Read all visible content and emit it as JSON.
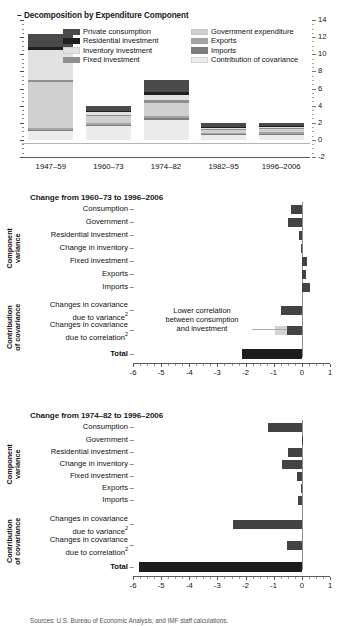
{
  "chart_data": [
    {
      "type": "bar",
      "title": "Decomposition by Expenditure Component",
      "stacked": true,
      "orientation": "vertical",
      "categories": [
        "1947–59",
        "1960–73",
        "1974–82",
        "1982–95",
        "1996–2006"
      ],
      "ylim": [
        -2,
        14
      ],
      "yticks": [
        -2,
        0,
        2,
        4,
        6,
        8,
        10,
        12,
        14
      ],
      "ytick_labels": [
        "-2",
        "0",
        "2",
        "4",
        "6",
        "8",
        "10",
        "12",
        "14"
      ],
      "xlabel": "",
      "ylabel": "",
      "grid": false,
      "legend_position": "top-inside",
      "series": [
        {
          "name": "Private consumption",
          "color": "#4a4a4a",
          "values": [
            1.5,
            0.62,
            1.45,
            0.55,
            0.4
          ]
        },
        {
          "name": "Residential investment",
          "color": "#1f1f1f",
          "values": [
            0.35,
            0.12,
            0.35,
            0.1,
            0.12
          ]
        },
        {
          "name": "Inventory investment",
          "color": "#e2e2e2",
          "values": [
            3.55,
            0.3,
            0.55,
            0.1,
            0.08
          ]
        },
        {
          "name": "Fixed investment",
          "color": "#8f8f8f",
          "values": [
            0.22,
            0.18,
            0.3,
            0.12,
            0.15
          ]
        },
        {
          "name": "Government expenditure",
          "color": "#d0d0d0",
          "values": [
            5.4,
            0.85,
            1.6,
            0.35,
            0.3
          ]
        },
        {
          "name": "Exports",
          "color": "#a3a3a3",
          "values": [
            0.22,
            0.18,
            0.22,
            0.1,
            0.22
          ]
        },
        {
          "name": "Imports",
          "color": "#7d7d7d",
          "values": [
            0.18,
            0.15,
            0.2,
            0.1,
            0.18
          ]
        },
        {
          "name": "Contribution of covariance",
          "color": "#ececec",
          "values": [
            0.98,
            1.6,
            2.33,
            0.58,
            0.55
          ]
        }
      ]
    },
    {
      "type": "bar",
      "orientation": "horizontal",
      "title": "Change from 1960–73 to 1996–2006",
      "xlim": [
        -6,
        1
      ],
      "xticks": [
        -6,
        -5,
        -4,
        -3,
        -2,
        -1,
        0,
        1
      ],
      "xtick_labels": [
        "-6",
        "-5",
        "-4",
        "-3",
        "-2",
        "-1",
        "0",
        "1"
      ],
      "group_captions": [
        "Component\nvariance",
        "Contribution\nof covariance"
      ],
      "categories": [
        "Consumption",
        "Government",
        "Residential investment",
        "Change in inventory",
        "Fixed investment",
        "Exports",
        "Imports",
        "Changes in covariance due to variance",
        "Changes in covariance due to correlation",
        "Total"
      ],
      "values": [
        -0.4,
        -0.5,
        -0.1,
        -0.02,
        0.17,
        0.15,
        0.28,
        -0.73,
        -0.52,
        -2.13
      ],
      "split_bars": [
        {
          "category_index": 8,
          "light_value": -0.95,
          "dark_value": -0.52,
          "light_color": "#d2d2d2"
        }
      ],
      "annotation": {
        "lines": [
          "Lower correlation",
          "between consumption",
          "and investment"
        ],
        "target_category_index": 8
      }
    },
    {
      "type": "bar",
      "orientation": "horizontal",
      "title": "Change from 1974–82 to 1996–2006",
      "xlim": [
        -6,
        1
      ],
      "xticks": [
        -6,
        -5,
        -4,
        -3,
        -2,
        -1,
        0,
        1
      ],
      "xtick_labels": [
        "-6",
        "-5",
        "-4",
        "-3",
        "-2",
        "-1",
        "0",
        "1"
      ],
      "group_captions": [
        "Component\nvariance",
        "Contribution\nof covariance"
      ],
      "categories": [
        "Consumption",
        "Government",
        "Residential investment",
        "Change in inventory",
        "Fixed investment",
        "Exports",
        "Imports",
        "Changes in covariance due to variance",
        "Changes in covariance due to correlation",
        "Total"
      ],
      "values": [
        -1.22,
        0.0,
        -0.48,
        -0.7,
        -0.17,
        -0.03,
        -0.13,
        -2.45,
        -0.52,
        -5.8
      ]
    }
  ],
  "panel1": {
    "title": "Decomposition by Expenditure Component",
    "title_dash": "–",
    "legend": [
      {
        "label": "Private consumption",
        "color": "#4a4a4a"
      },
      {
        "label": "Residential investment",
        "color": "#1f1f1f"
      },
      {
        "label": "Inventory investment",
        "color": "#e2e2e2"
      },
      {
        "label": "Fixed investment",
        "color": "#8f8f8f"
      },
      {
        "label": "Government expenditure",
        "color": "#d0d0d0"
      },
      {
        "label": "Exports",
        "color": "#a3a3a3"
      },
      {
        "label": "Imports",
        "color": "#7d7d7d"
      },
      {
        "label": "Contribution of covariance",
        "color": "#ececec"
      }
    ],
    "ytick_labels": [
      "14",
      "12",
      "10",
      "8",
      "6",
      "4",
      "2",
      "0",
      "-2"
    ],
    "xcats": [
      "1947–59",
      "1960–73",
      "1974–82",
      "1982–95",
      "1996–2006"
    ]
  },
  "panel2": {
    "title": "Change from 1960–73 to 1996–2006",
    "dash": "–",
    "group1": "Component",
    "group1b": "variance",
    "group2": "Contribution",
    "group2b": "of covariance",
    "rows": [
      {
        "label": "Consumption"
      },
      {
        "label": "Government"
      },
      {
        "label": "Residential investment"
      },
      {
        "label": "Change in inventory"
      },
      {
        "label": "Fixed investment"
      },
      {
        "label": "Exports"
      },
      {
        "label": "Imports"
      },
      {
        "label": "Changes in covariance"
      },
      {
        "label": "due to variance"
      },
      {
        "label": "Changes in covariance"
      },
      {
        "label": "due to correlation"
      },
      {
        "label": "Total"
      }
    ],
    "sup": "2",
    "xtick_labels": [
      "-6",
      "-5",
      "-4",
      "-3",
      "-2",
      "-1",
      "0",
      "1"
    ],
    "annotation_line1": "Lower correlation",
    "annotation_line2": "between consumption",
    "annotation_line3": "and investment"
  },
  "panel3": {
    "title": "Change from 1974–82 to 1996–2006",
    "dash": "–",
    "group1": "Component",
    "group1b": "variance",
    "group2": "Contribution",
    "group2b": "of covariance",
    "rows": [
      {
        "label": "Consumption"
      },
      {
        "label": "Government"
      },
      {
        "label": "Residential investment"
      },
      {
        "label": "Change in inventory"
      },
      {
        "label": "Fixed investment"
      },
      {
        "label": "Exports"
      },
      {
        "label": "Imports"
      },
      {
        "label": "Changes in covariance"
      },
      {
        "label": "due to variance"
      },
      {
        "label": "Changes in covariance"
      },
      {
        "label": "due to correlation"
      },
      {
        "label": "Total"
      }
    ],
    "sup": "2",
    "xtick_labels": [
      "-6",
      "-5",
      "-4",
      "-3",
      "-2",
      "-1",
      "0",
      "1"
    ]
  },
  "source": "Sources: U.S. Bureau of Economic Analysis; and IMF staff calculations."
}
